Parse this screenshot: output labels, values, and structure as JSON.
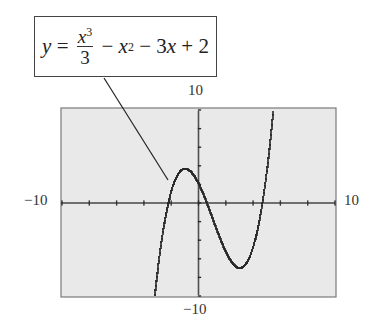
{
  "chart_data": {
    "type": "line",
    "equation": {
      "lhs": "y",
      "frac_num_base": "x",
      "frac_num_exp": "3",
      "frac_den": "3",
      "term2": "x",
      "term2_exp": "2",
      "term3": "3x",
      "const": "2"
    },
    "xlim": [
      -10,
      10
    ],
    "ylim": [
      -10,
      10
    ],
    "x_tick_step": 2,
    "y_tick_step": 2,
    "labels": {
      "x_min": "−10",
      "x_max": "10",
      "y_min": "−10",
      "y_max": "10"
    },
    "series": [
      {
        "name": "y = x^3/3 - x^2 - 3x + 2",
        "x": [
          -3.2,
          -3,
          -2.5,
          -2,
          -1.5,
          -1,
          -0.5,
          0,
          0.5,
          1,
          1.5,
          2,
          2.5,
          3,
          3.5,
          4,
          4.5,
          5,
          5.2
        ],
        "values": [
          -9.7,
          -7,
          -2.96,
          1.33,
          3.13,
          3.67,
          3.21,
          2,
          0.29,
          -1.67,
          -3.63,
          -5.33,
          -6.54,
          -7,
          -6.46,
          -4.67,
          -1.38,
          3.67,
          6.0
        ]
      }
    ],
    "key_points": {
      "local_max": [
        -1,
        3.667
      ],
      "local_min": [
        3,
        -7
      ]
    },
    "grid": false,
    "legend": "callout box with leader line"
  },
  "colors": {
    "screen_bg": "#e9e9e9",
    "screen_border": "#7a7a7a",
    "ink": "#2a2a2a"
  }
}
